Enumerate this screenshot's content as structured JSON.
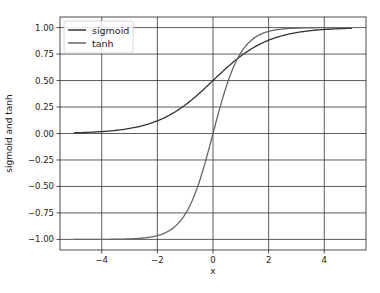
{
  "chart_data": {
    "type": "line",
    "title": "",
    "xlabel": "x",
    "ylabel": "sigmoid and tanh",
    "xlim": [
      -5.5,
      5.5
    ],
    "ylim": [
      -1.1,
      1.1
    ],
    "grid": true,
    "legend_position": "upper left",
    "x_ticks": [
      -4,
      -2,
      0,
      2,
      4
    ],
    "x_tick_labels": [
      "−4",
      "−2",
      "0",
      "2",
      "4"
    ],
    "y_ticks": [
      1.0,
      0.75,
      0.5,
      0.25,
      0.0,
      -0.25,
      -0.5,
      -0.75,
      -1.0
    ],
    "y_tick_labels": [
      "1.00",
      "0.75",
      "0.50",
      "0.25",
      "0.00",
      "−0.25",
      "−0.50",
      "−0.75",
      "−1.00"
    ],
    "x_range": [
      -5,
      5
    ],
    "series": [
      {
        "name": "sigmoid",
        "function": "1/(1+exp(-x))",
        "color": "#333333",
        "x": [
          -5,
          -4,
          -3,
          -2,
          -1,
          0,
          1,
          2,
          3,
          4,
          5
        ],
        "values": [
          0.007,
          0.018,
          0.047,
          0.119,
          0.269,
          0.5,
          0.731,
          0.881,
          0.953,
          0.982,
          0.993
        ]
      },
      {
        "name": "tanh",
        "function": "tanh(x)",
        "color": "#666666",
        "x": [
          -5,
          -4,
          -3,
          -2,
          -1,
          0,
          1,
          2,
          3,
          4,
          5
        ],
        "values": [
          -1.0,
          -0.999,
          -0.995,
          -0.964,
          -0.762,
          0.0,
          0.762,
          0.964,
          0.995,
          0.999,
          1.0
        ]
      }
    ]
  }
}
